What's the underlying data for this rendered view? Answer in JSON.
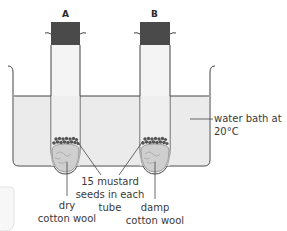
{
  "diagram": {
    "tubes": [
      {
        "id": "A",
        "label": "A",
        "contents": "dry cotton wool"
      },
      {
        "id": "B",
        "label": "B",
        "contents": "damp cotton wool"
      }
    ],
    "labels": {
      "water_bath_line1": "water bath at",
      "water_bath_line2": "20°C",
      "seeds_line1": "15 mustard",
      "seeds_line2": "seeds in each",
      "seeds_line3": "tube",
      "dry_line1": "dry",
      "dry_line2": "cotton wool",
      "damp_line1": "damp",
      "damp_line2": "cotton wool"
    },
    "colors": {
      "water": "#ebebeb",
      "bung": "#4a4a4a",
      "outline": "#3a3a3a",
      "cotton": "#cfcfcf",
      "seeds": "#555555"
    }
  }
}
